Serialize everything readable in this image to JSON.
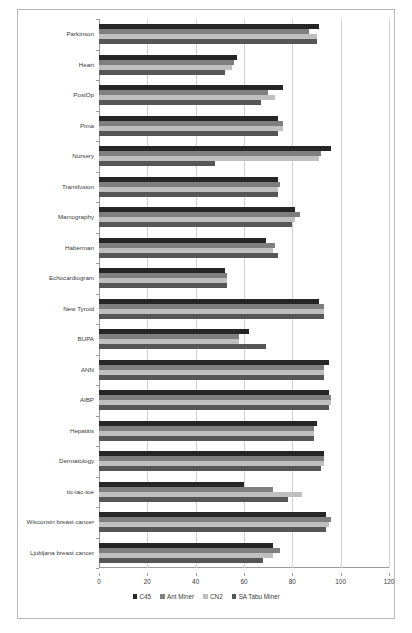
{
  "chart_data": {
    "type": "bar",
    "orientation": "horizontal",
    "title": "",
    "xlabel": "",
    "ylabel": "",
    "xlim": [
      0,
      120
    ],
    "xticks": [
      0,
      20,
      40,
      60,
      80,
      100,
      120
    ],
    "grid": true,
    "legend_position": "bottom",
    "categories": [
      "Parkinson",
      "Heart",
      "PostOp",
      "Pima",
      "Nursery",
      "Transfusion",
      "Mamography",
      "Haberman",
      "Echocardiogram",
      "New Tyroid",
      "BUPA",
      "ANN",
      "AIBP",
      "Hepatitis",
      "Dermatology",
      "tic-tac-toe",
      "Wisconsin breast cancer",
      "Ljubljana breast cancer"
    ],
    "series": [
      {
        "name": "C45",
        "color": "#262626",
        "values": [
          91,
          57,
          76,
          74,
          96,
          74,
          81,
          69,
          52,
          91,
          62,
          95,
          95,
          90,
          93,
          60,
          94,
          72
        ]
      },
      {
        "name": "Ant Miner",
        "color": "#7f7f7f",
        "values": [
          87,
          56,
          70,
          76,
          92,
          75,
          83,
          73,
          53,
          93,
          58,
          93,
          96,
          89,
          93,
          72,
          96,
          75
        ]
      },
      {
        "name": "CN2",
        "color": "#bfbfbf",
        "values": [
          90,
          55,
          73,
          76,
          91,
          74,
          81,
          72,
          53,
          93,
          58,
          93,
          96,
          89,
          93,
          84,
          95,
          72
        ]
      },
      {
        "name": "SA Tabu Miner",
        "color": "#565656",
        "values": [
          90,
          52,
          67,
          74,
          48,
          74,
          80,
          74,
          53,
          93,
          69,
          93,
          95,
          89,
          92,
          78,
          94,
          68
        ]
      }
    ]
  },
  "legend": {
    "items": [
      {
        "label": "C45"
      },
      {
        "label": "Ant Miner"
      },
      {
        "label": "CN2"
      },
      {
        "label": "SA Tabu Miner"
      }
    ]
  },
  "axis": {
    "x_tick_labels": [
      "0",
      "20",
      "40",
      "60",
      "80",
      "100",
      "120"
    ]
  }
}
